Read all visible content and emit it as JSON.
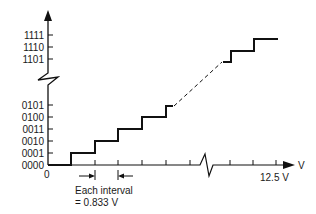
{
  "diagram": {
    "y_labels": [
      "1111",
      "1110",
      "1101",
      "0101",
      "0100",
      "0011",
      "0010",
      "0001",
      "0000"
    ],
    "x_origin_label": "0",
    "x_end_label": "12.5 V",
    "x_axis_unit": "V",
    "interval_note_line1": "Each interval",
    "interval_note_line2": "= 0.833 V"
  }
}
